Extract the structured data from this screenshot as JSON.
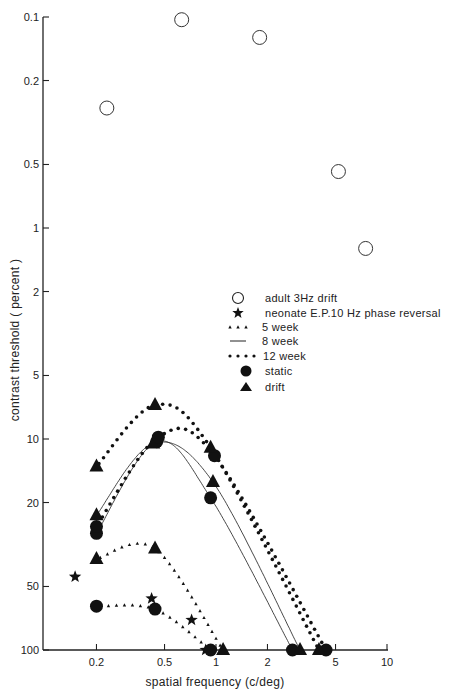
{
  "chart_data": {
    "type": "scatter",
    "title": "",
    "xlabel": "spatial frequency (c/deg)",
    "ylabel": "contrast threshold ( percent )",
    "xscale": "log",
    "yscale": "log",
    "y_inverted": true,
    "xlim": [
      0.13,
      10
    ],
    "ylim": [
      0.1,
      100
    ],
    "x_ticks": [
      0.2,
      0.5,
      1,
      2,
      5,
      10
    ],
    "x_tick_labels": [
      "0.2",
      "0.5",
      "1",
      "2",
      "5",
      "10"
    ],
    "y_ticks": [
      0.1,
      0.2,
      0.5,
      1,
      2,
      5,
      10,
      20,
      50,
      100
    ],
    "y_tick_labels": [
      "0.1",
      "0.2",
      "0.5",
      "1",
      "2",
      "5",
      "10",
      "20",
      "50",
      "100"
    ],
    "grid": false,
    "legend_position": "center-right",
    "legend": [
      {
        "marker": "open-circle",
        "label": "adult  3Hz drift"
      },
      {
        "marker": "star",
        "label": "neonate  E.P.10 Hz  phase reversal"
      },
      {
        "marker": "small-triangle-dots",
        "label": "5 week"
      },
      {
        "marker": "solid-line",
        "label": "8 week"
      },
      {
        "marker": "dots",
        "label": "12 week"
      },
      {
        "marker": "filled-circle",
        "label": "static"
      },
      {
        "marker": "filled-triangle",
        "label": "drift"
      }
    ],
    "series": [
      {
        "name": "adult 3Hz drift",
        "marker": "open-circle",
        "line": "none",
        "points": [
          [
            0.23,
            0.27
          ],
          [
            0.63,
            0.103
          ],
          [
            1.8,
            0.125
          ],
          [
            5.2,
            0.54
          ],
          [
            7.5,
            1.25
          ]
        ]
      },
      {
        "name": "neonate E.P. 10Hz phase reversal",
        "marker": "star",
        "line": "none",
        "points": [
          [
            0.15,
            45
          ],
          [
            0.42,
            57
          ],
          [
            0.72,
            72
          ],
          [
            0.87,
            100
          ]
        ]
      },
      {
        "name": "5 week static",
        "marker": "filled-circle",
        "line": "small-triangles",
        "points": [
          [
            0.2,
            62
          ],
          [
            0.44,
            64
          ],
          [
            0.93,
            100
          ]
        ]
      },
      {
        "name": "5 week drift",
        "marker": "filled-triangle",
        "line": "small-triangles",
        "points": [
          [
            0.2,
            37
          ],
          [
            0.44,
            33
          ],
          [
            1.1,
            100
          ]
        ]
      },
      {
        "name": "8 week static",
        "marker": "filled-circle",
        "line": "solid",
        "points": [
          [
            0.2,
            28
          ],
          [
            0.45,
            10.3
          ],
          [
            0.93,
            19
          ],
          [
            2.8,
            100
          ]
        ]
      },
      {
        "name": "8 week drift",
        "marker": "filled-triangle",
        "line": "solid",
        "points": [
          [
            0.2,
            23
          ],
          [
            0.43,
            10.5
          ],
          [
            0.96,
            16
          ],
          [
            3.1,
            100
          ]
        ]
      },
      {
        "name": "12 week static",
        "marker": "filled-circle",
        "line": "dots",
        "points": [
          [
            0.2,
            26
          ],
          [
            0.46,
            9.8
          ],
          [
            0.98,
            12
          ],
          [
            4.4,
            100
          ]
        ]
      },
      {
        "name": "12 week drift",
        "marker": "filled-triangle",
        "line": "dots",
        "points": [
          [
            0.2,
            13.5
          ],
          [
            0.44,
            6.9
          ],
          [
            0.93,
            11
          ],
          [
            4.0,
            100
          ]
        ]
      }
    ]
  },
  "legend_items": {
    "adult": "adult  3Hz drift",
    "neonate": "neonate  E.P.10 Hz  phase reversal",
    "w5": "5 week",
    "w8": "8 week",
    "w12": "12 week",
    "static": "static",
    "drift": "drift"
  },
  "axes": {
    "xlabel": "spatial frequency (c/deg)",
    "ylabel": "contrast threshold ( percent )"
  }
}
